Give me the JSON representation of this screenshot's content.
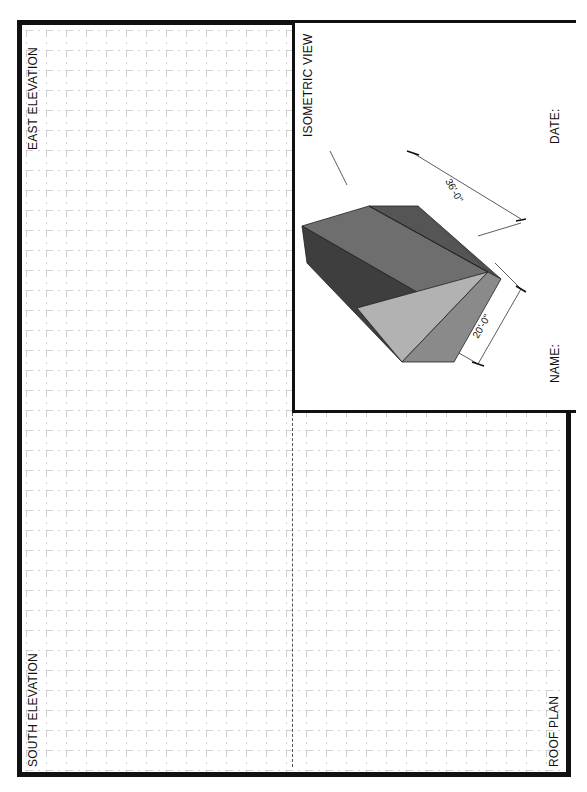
{
  "sheet": {
    "labels": {
      "east_elevation": "EAST ELEVATION",
      "south_elevation": "SOUTH ELEVATION",
      "roof_plan": "ROOF PLAN",
      "isometric_view": "ISOMETRIC VIEW",
      "name": "NAME:",
      "date": "DATE:"
    },
    "dimensions": {
      "length": "36'-0\"",
      "width": "20'-0\""
    },
    "grid": {
      "spacing_px": 20,
      "line_color": "#9a9a9a"
    },
    "colors": {
      "border": "#111111",
      "roof_left": "#6e6e6e",
      "roof_right": "#585858",
      "side_wall": "#3e3e3e",
      "gable_end": "#b2b2b2",
      "end_wall": "#8a8a8a"
    }
  }
}
